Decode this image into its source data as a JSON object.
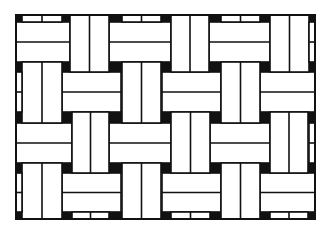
{
  "diagram": {
    "title": "Basket weave pattern",
    "stroke_color": "#111111",
    "fill_color": "#ffffff",
    "gap_color": "#111111",
    "frame": {
      "x": 16,
      "y": 15,
      "w": 299,
      "h": 204
    },
    "horizontal_pairs": [
      {
        "x": 16,
        "y": 22,
        "w": 54,
        "h": 40
      },
      {
        "x": 109,
        "y": 22,
        "w": 62,
        "h": 40
      },
      {
        "x": 209,
        "y": 22,
        "w": 61,
        "h": 40
      },
      {
        "x": 62,
        "y": 72,
        "w": 59,
        "h": 40
      },
      {
        "x": 162,
        "y": 72,
        "w": 59,
        "h": 40
      },
      {
        "x": 260,
        "y": 72,
        "w": 55,
        "h": 40
      },
      {
        "x": 16,
        "y": 123,
        "w": 56,
        "h": 40
      },
      {
        "x": 109,
        "y": 123,
        "w": 62,
        "h": 40
      },
      {
        "x": 210,
        "y": 123,
        "w": 60,
        "h": 40
      },
      {
        "x": 62,
        "y": 173,
        "w": 59,
        "h": 39
      },
      {
        "x": 162,
        "y": 173,
        "w": 59,
        "h": 39
      },
      {
        "x": 260,
        "y": 173,
        "w": 55,
        "h": 39
      }
    ],
    "vertical_pairs": [
      {
        "x": 70,
        "y": 15,
        "w": 39,
        "h": 57
      },
      {
        "x": 171,
        "y": 15,
        "w": 38,
        "h": 57
      },
      {
        "x": 270,
        "y": 15,
        "w": 39,
        "h": 57
      },
      {
        "x": 22,
        "y": 62,
        "w": 40,
        "h": 61
      },
      {
        "x": 122,
        "y": 62,
        "w": 39,
        "h": 61
      },
      {
        "x": 221,
        "y": 62,
        "w": 39,
        "h": 61
      },
      {
        "x": 72,
        "y": 112,
        "w": 37,
        "h": 61
      },
      {
        "x": 171,
        "y": 112,
        "w": 39,
        "h": 61
      },
      {
        "x": 270,
        "y": 112,
        "w": 38,
        "h": 61
      },
      {
        "x": 22,
        "y": 163,
        "w": 40,
        "h": 56
      },
      {
        "x": 122,
        "y": 163,
        "w": 39,
        "h": 56
      },
      {
        "x": 221,
        "y": 163,
        "w": 39,
        "h": 56
      }
    ],
    "edge_strips_horizontal": [
      {
        "x": 22,
        "y": 15,
        "w": 40,
        "h": 7
      },
      {
        "x": 122,
        "y": 15,
        "w": 39,
        "h": 7
      },
      {
        "x": 221,
        "y": 15,
        "w": 39,
        "h": 7
      },
      {
        "x": 72,
        "y": 212,
        "w": 37,
        "h": 7
      },
      {
        "x": 171,
        "y": 212,
        "w": 39,
        "h": 7
      },
      {
        "x": 270,
        "y": 212,
        "w": 38,
        "h": 7
      }
    ],
    "edge_strips_vertical": [
      {
        "x": 309,
        "y": 22,
        "w": 6,
        "h": 40
      },
      {
        "x": 16,
        "y": 72,
        "w": 6,
        "h": 40
      },
      {
        "x": 309,
        "y": 123,
        "w": 6,
        "h": 40
      },
      {
        "x": 16,
        "y": 173,
        "w": 6,
        "h": 39
      }
    ],
    "gap_squares": [
      {
        "x": 16,
        "y": 15,
        "w": 6,
        "h": 7
      },
      {
        "x": 62,
        "y": 15,
        "w": 8,
        "h": 7
      },
      {
        "x": 109,
        "y": 15,
        "w": 13,
        "h": 7
      },
      {
        "x": 161,
        "y": 15,
        "w": 10,
        "h": 7
      },
      {
        "x": 209,
        "y": 15,
        "w": 12,
        "h": 7
      },
      {
        "x": 260,
        "y": 15,
        "w": 10,
        "h": 7
      },
      {
        "x": 309,
        "y": 15,
        "w": 6,
        "h": 7
      },
      {
        "x": 16,
        "y": 62,
        "w": 6,
        "h": 10
      },
      {
        "x": 62,
        "y": 62,
        "w": 8,
        "h": 10
      },
      {
        "x": 109,
        "y": 62,
        "w": 13,
        "h": 10
      },
      {
        "x": 161,
        "y": 62,
        "w": 10,
        "h": 10
      },
      {
        "x": 209,
        "y": 62,
        "w": 12,
        "h": 10
      },
      {
        "x": 260,
        "y": 62,
        "w": 10,
        "h": 10
      },
      {
        "x": 309,
        "y": 62,
        "w": 6,
        "h": 10
      },
      {
        "x": 16,
        "y": 112,
        "w": 6,
        "h": 11
      },
      {
        "x": 62,
        "y": 112,
        "w": 10,
        "h": 11
      },
      {
        "x": 109,
        "y": 112,
        "w": 13,
        "h": 11
      },
      {
        "x": 161,
        "y": 112,
        "w": 10,
        "h": 11
      },
      {
        "x": 210,
        "y": 112,
        "w": 11,
        "h": 11
      },
      {
        "x": 260,
        "y": 112,
        "w": 10,
        "h": 11
      },
      {
        "x": 308,
        "y": 112,
        "w": 7,
        "h": 11
      },
      {
        "x": 16,
        "y": 163,
        "w": 6,
        "h": 10
      },
      {
        "x": 62,
        "y": 163,
        "w": 10,
        "h": 10
      },
      {
        "x": 109,
        "y": 163,
        "w": 13,
        "h": 10
      },
      {
        "x": 161,
        "y": 163,
        "w": 10,
        "h": 10
      },
      {
        "x": 210,
        "y": 163,
        "w": 11,
        "h": 10
      },
      {
        "x": 260,
        "y": 163,
        "w": 10,
        "h": 10
      },
      {
        "x": 308,
        "y": 163,
        "w": 7,
        "h": 10
      },
      {
        "x": 16,
        "y": 212,
        "w": 6,
        "h": 7
      },
      {
        "x": 62,
        "y": 212,
        "w": 10,
        "h": 7
      },
      {
        "x": 109,
        "y": 212,
        "w": 13,
        "h": 7
      },
      {
        "x": 161,
        "y": 212,
        "w": 10,
        "h": 7
      },
      {
        "x": 210,
        "y": 212,
        "w": 11,
        "h": 7
      },
      {
        "x": 260,
        "y": 212,
        "w": 10,
        "h": 7
      },
      {
        "x": 308,
        "y": 212,
        "w": 7,
        "h": 7
      }
    ]
  }
}
